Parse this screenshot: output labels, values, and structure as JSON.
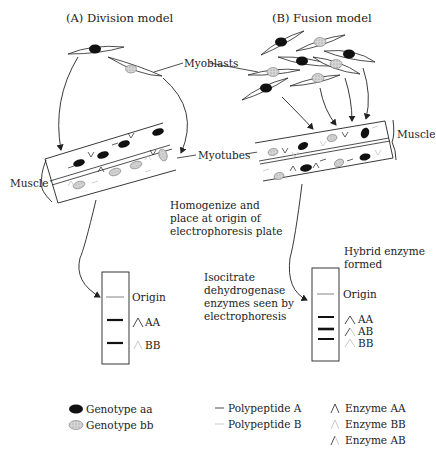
{
  "panels": {
    "a": {
      "title": "(A) Division model"
    },
    "b": {
      "title": "(B) Fusion model"
    }
  },
  "labels": {
    "myoblasts": "Myoblasts",
    "myotubes": "Myotubes",
    "muscle_left": "Muscle",
    "muscle_right": "Muscle",
    "homogenize_1": "Homogenize and",
    "homogenize_2": "place at origin of",
    "homogenize_3": "electrophoresis plate",
    "isocitrate_1": "Isocitrate",
    "isocitrate_2": "dehydrogenase",
    "isocitrate_3": "enzymes seen by",
    "isocitrate_4": "electrophoresis",
    "hybrid_1": "Hybrid enzyme",
    "hybrid_2": "formed"
  },
  "gels": {
    "a": {
      "origin": "Origin",
      "bands": [
        "AA",
        "BB"
      ]
    },
    "b": {
      "origin": "Origin",
      "bands": [
        "AA",
        "AB",
        "BB"
      ]
    }
  },
  "legend": {
    "genotypes": [
      {
        "label": "Genotype aa",
        "icon": "black-nucleus"
      },
      {
        "label": "Genotype bb",
        "icon": "stippled-nucleus"
      }
    ],
    "polypeptides": [
      {
        "label": "Polypeptide A",
        "icon": "dark-line"
      },
      {
        "label": "Polypeptide B",
        "icon": "light-line"
      }
    ],
    "enzymes": [
      {
        "label": "Enzyme AA",
        "icon": "dark-chevron"
      },
      {
        "label": "Enzyme BB",
        "icon": "light-chevron"
      },
      {
        "label": "Enzyme AB",
        "icon": "mixed-chevron"
      }
    ]
  },
  "colors": {
    "ink": "#222222",
    "nucleus_aa": "#111111",
    "nucleus_bb": "#bbbbbb",
    "polypeptide_b": "#bbbbbb"
  }
}
